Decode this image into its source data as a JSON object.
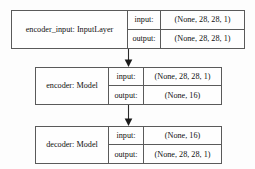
{
  "diagram": {
    "type": "keras-model-plot",
    "title": "",
    "nodes": [
      {
        "id": "encoder_input",
        "label": "encoder_input: InputLayer",
        "input_key": "input:",
        "input_value": "(None, 28, 28, 1)",
        "output_key": "output:",
        "output_value": "(None, 28, 28, 1)"
      },
      {
        "id": "encoder",
        "label": "encoder: Model",
        "input_key": "input:",
        "input_value": "(None, 28, 28, 1)",
        "output_key": "output:",
        "output_value": "(None, 16)"
      },
      {
        "id": "decoder",
        "label": "decoder: Model",
        "input_key": "input:",
        "input_value": "(None, 16)",
        "output_key": "output:",
        "output_value": "(None, 28, 28, 1)"
      }
    ],
    "edges": [
      {
        "from": "encoder_input",
        "to": "encoder",
        "arrow": "down-arrow-icon"
      },
      {
        "from": "encoder",
        "to": "decoder",
        "arrow": "down-arrow-icon"
      }
    ],
    "colors": {
      "border": "#5a5a5a",
      "node_background": "#fefefe",
      "canvas_background": "#fdfdfd",
      "text": "#111111",
      "edge": "#2b2b2b"
    }
  }
}
